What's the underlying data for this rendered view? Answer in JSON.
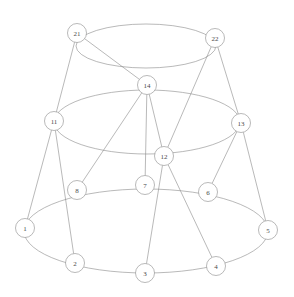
{
  "figure": {
    "title": "",
    "background_color": "#ffffff",
    "node_fill": "#ffffff",
    "node_stroke": "#8a8a8a",
    "edge_color": "#8a8a8a",
    "label_color": "#4a4a4a",
    "width": 294,
    "height": 297
  },
  "chart_data": {
    "type": "diagram",
    "diagram_type": "node-link-graph",
    "title": "",
    "layout": "three-tier concentric rings (prism / stacked-cycle drawing)",
    "node_count": 15,
    "nodes": [
      {
        "id": "1",
        "label": "1",
        "x": 25,
        "y": 228,
        "r": 9.5,
        "tier": "bottom"
      },
      {
        "id": "2",
        "label": "2",
        "x": 75,
        "y": 263,
        "r": 9.5,
        "tier": "bottom"
      },
      {
        "id": "3",
        "label": "3",
        "x": 145,
        "y": 273,
        "r": 9.5,
        "tier": "bottom"
      },
      {
        "id": "4",
        "label": "4",
        "x": 216,
        "y": 266,
        "r": 9.5,
        "tier": "bottom"
      },
      {
        "id": "5",
        "label": "5",
        "x": 268,
        "y": 230,
        "r": 9.5,
        "tier": "bottom"
      },
      {
        "id": "6",
        "label": "6",
        "x": 208,
        "y": 192,
        "r": 9.5,
        "tier": "bottom"
      },
      {
        "id": "7",
        "label": "7",
        "x": 145,
        "y": 185,
        "r": 9.5,
        "tier": "bottom"
      },
      {
        "id": "8",
        "label": "8",
        "x": 77,
        "y": 190,
        "r": 9.5,
        "tier": "bottom"
      },
      {
        "id": "11",
        "label": "11",
        "x": 54,
        "y": 121,
        "r": 9.5,
        "tier": "middle"
      },
      {
        "id": "12",
        "label": "12",
        "x": 164,
        "y": 156,
        "r": 9.5,
        "tier": "middle"
      },
      {
        "id": "13",
        "label": "13",
        "x": 241,
        "y": 123,
        "r": 9.5,
        "tier": "middle"
      },
      {
        "id": "14",
        "label": "14",
        "x": 147,
        "y": 85,
        "r": 9.5,
        "tier": "middle"
      },
      {
        "id": "21",
        "label": "21",
        "x": 77,
        "y": 33,
        "r": 9.5,
        "tier": "top"
      },
      {
        "id": "22",
        "label": "22",
        "x": 215,
        "y": 38,
        "r": 9.5,
        "tier": "top"
      }
    ],
    "rings": [
      {
        "name": "top-ring",
        "cx": 146,
        "cy": 46,
        "rx": 70,
        "ry": 22,
        "passes_through": [
          "21",
          "22"
        ]
      },
      {
        "name": "middle-ring",
        "cx": 147,
        "cy": 122,
        "rx": 93,
        "ry": 32,
        "passes_through": [
          "11",
          "13",
          "14",
          "12"
        ]
      },
      {
        "name": "bottom-ring",
        "cx": 146,
        "cy": 231,
        "rx": 122,
        "ry": 42,
        "passes_through": [
          "1",
          "2",
          "3",
          "4",
          "5",
          "6",
          "7",
          "8"
        ]
      }
    ],
    "edges": [
      {
        "source": "21",
        "target": "14"
      },
      {
        "source": "21",
        "target": "11"
      },
      {
        "source": "22",
        "target": "13"
      },
      {
        "source": "22",
        "target": "12"
      },
      {
        "source": "14",
        "target": "8"
      },
      {
        "source": "14",
        "target": "7"
      },
      {
        "source": "14",
        "target": "12"
      },
      {
        "source": "11",
        "target": "1"
      },
      {
        "source": "11",
        "target": "2"
      },
      {
        "source": "13",
        "target": "6"
      },
      {
        "source": "13",
        "target": "5"
      },
      {
        "source": "12",
        "target": "3"
      },
      {
        "source": "12",
        "target": "4"
      }
    ],
    "edge_count": 13
  }
}
